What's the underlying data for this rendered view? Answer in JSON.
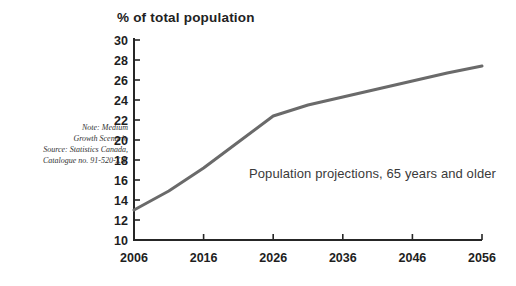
{
  "chart_data": {
    "type": "line",
    "title": "% of total population",
    "ylabel": "% of total population",
    "xlabel": "",
    "annotation": "Population projections, 65 years and older",
    "x": [
      2006,
      2011,
      2016,
      2021,
      2026,
      2031,
      2036,
      2041,
      2046,
      2051,
      2056
    ],
    "values": [
      13.0,
      14.9,
      17.2,
      19.8,
      22.4,
      23.5,
      24.3,
      25.1,
      25.9,
      26.7,
      27.4
    ],
    "series_name": "Population 65 years and older, medium growth scenario",
    "xlim": [
      2006,
      2056
    ],
    "ylim": [
      10,
      30
    ],
    "x_ticks": [
      2006,
      2016,
      2026,
      2036,
      2046,
      2056
    ],
    "y_ticks": [
      10,
      12,
      14,
      16,
      18,
      20,
      22,
      24,
      26,
      28,
      30
    ],
    "grid": false,
    "legend": "none",
    "line_color": "#6a6a6a",
    "axis_color": "#262626",
    "tick_label_color": "#1e1e1e"
  },
  "note": {
    "lines": [
      "Note: Medium",
      "Growth Scenario",
      "Source: Statistics Canada,",
      "Catalogue no. 91-520-XIE"
    ]
  }
}
